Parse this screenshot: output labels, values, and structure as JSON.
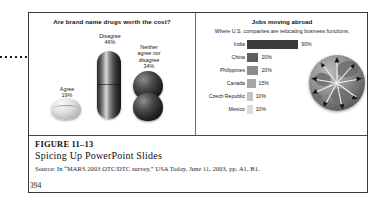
{
  "figure": {
    "number": "FIGURE 11–13",
    "title": "Spicing Up PowerPoint Slides",
    "source": "Source:  In “MARS 2003 OTC/DTC survey,” USA Today, June 11, 2003, pp. A1, B1.",
    "page_number": "394"
  },
  "annotation": {
    "pointer_name": "callout-arrow"
  },
  "left_chart": {
    "title": "Are brand name drugs worth the cost?",
    "labels": {
      "disagree": "Disagree\n46%",
      "disagree_text": "Disagree",
      "disagree_value": "46%",
      "neither_text": "Neither\nagree nor\ndisagree",
      "neither_value": "34%",
      "agree_text": "Agree",
      "agree_value": "19%"
    },
    "chart_data": {
      "type": "pie",
      "title": "Are brand name drugs worth the cost?",
      "categories": [
        "Disagree",
        "Neither agree nor disagree",
        "Agree"
      ],
      "values": [
        46,
        34,
        19
      ],
      "value_labels": [
        "46%",
        "34%",
        "19%"
      ],
      "units": "percent",
      "legend": "none",
      "notes": "Pictorial chart: values drawn as 3-D pill/capsule, stacked spheres, and a tablet."
    }
  },
  "right_chart": {
    "title": "Jobs moving abroad",
    "subtitle": "Where U.S. companies are relocating business functions.",
    "chart_data": {
      "type": "bar",
      "orientation": "horizontal",
      "title": "Jobs moving abroad",
      "subtitle": "Where U.S. companies are relocating business functions.",
      "categories": [
        "India",
        "China",
        "Philippines",
        "Canada",
        "Czech Republic",
        "Mexico"
      ],
      "values": [
        90,
        20,
        20,
        15,
        10,
        10
      ],
      "value_labels": [
        "90%",
        "20%",
        "20%",
        "15%",
        "10%",
        "10%"
      ],
      "xlabel": "",
      "ylabel": "",
      "xlim": [
        0,
        100
      ],
      "grid": false,
      "legend": "none",
      "bar_colors": [
        "#3b3b3b",
        "#5e5e5e",
        "#8c8c8c",
        "#a6a6a6",
        "#c4c4c4",
        "#dcdcdc"
      ]
    },
    "rows": [
      {
        "name": "India",
        "value": "90%",
        "pct": 90,
        "color": "#3b3b3b"
      },
      {
        "name": "China",
        "value": "20%",
        "pct": 20,
        "color": "#5e5e5e"
      },
      {
        "name": "Philippines",
        "value": "20%",
        "pct": 20,
        "color": "#8c8c8c"
      },
      {
        "name": "Canada",
        "value": "15%",
        "pct": 15,
        "color": "#a6a6a6"
      },
      {
        "name": "Czech Republic",
        "value": "10%",
        "pct": 10,
        "color": "#c4c4c4"
      },
      {
        "name": "Mexico",
        "value": "10%",
        "pct": 10,
        "color": "#dcdcdc"
      }
    ],
    "globe_name": "globe-graphic"
  },
  "colors": {
    "frame": "#3a3a3a",
    "text": "#111111",
    "background": "#ffffff"
  }
}
